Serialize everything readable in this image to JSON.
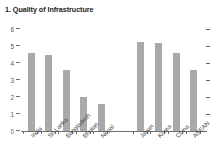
{
  "chart_data": {
    "type": "bar",
    "title": "1. Quality of Infrastructure",
    "xlabel": "",
    "ylabel": "",
    "ylim": [
      0,
      6
    ],
    "yticks": [
      "0",
      "1",
      "2",
      "3",
      "4",
      "5",
      "6"
    ],
    "grid": false,
    "legend": "none",
    "bar_color": "#a9a9a9",
    "axis_color": "#6d6e71",
    "groups": [
      {
        "name": "South Asia",
        "categories": [
          "India",
          "Sri Lanka",
          "Bangladesh",
          "Bhutan",
          "Nepal"
        ],
        "values": [
          4.6,
          4.5,
          3.6,
          2.0,
          1.6
        ]
      },
      {
        "name": "Comparators",
        "categories": [
          "Japan",
          "Korea",
          "China",
          "ASEAN"
        ],
        "values": [
          5.25,
          5.2,
          4.6,
          3.6
        ]
      }
    ],
    "categories": [
      "India",
      "Sri Lanka",
      "Bangladesh",
      "Bhutan",
      "Nepal",
      "Japan",
      "Korea",
      "China",
      "ASEAN"
    ],
    "values": [
      4.6,
      4.5,
      3.6,
      2.0,
      1.6,
      5.25,
      5.2,
      4.6,
      3.6
    ]
  }
}
